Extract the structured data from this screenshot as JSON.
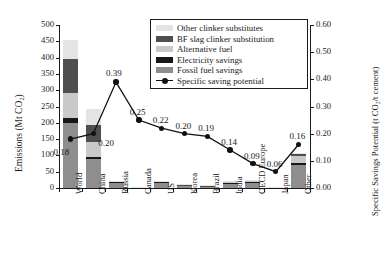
{
  "chart_data": {
    "type": "bar",
    "title": "",
    "subtitle": "",
    "xlabel": "",
    "ylabel": "Emissions (Mt CO2)",
    "ylabel_right": "Specific Savings Potential (t CO2/t cement)",
    "categories": [
      "World",
      "China",
      "Russia",
      "Canada",
      "US",
      "Korea",
      "Brazil",
      "India",
      "OECD Europe",
      "Japan",
      "Other"
    ],
    "ylim": [
      0,
      500
    ],
    "yticks": [
      "0",
      "50",
      "100",
      "150",
      "200",
      "250",
      "300",
      "350",
      "400",
      "450",
      "500"
    ],
    "ylim_right": [
      0,
      0.6
    ],
    "yticks_right": [
      "0.00",
      "0.10",
      "0.20",
      "0.30",
      "0.40",
      "0.50",
      "0.60"
    ],
    "grid": false,
    "legend_position": "top-right",
    "stacked": true,
    "series": [
      {
        "name": "Fossil fuel savings",
        "color": "#8e8e8e",
        "values": [
          200,
          88,
          16,
          2,
          16,
          7,
          5,
          15,
          16,
          2,
          72
        ]
      },
      {
        "name": "Electricity savings",
        "color": "#171717",
        "values": [
          14,
          7,
          1,
          0.3,
          1.5,
          1,
          0.6,
          1.5,
          1.5,
          0.3,
          6
        ]
      },
      {
        "name": "Alternative fuel",
        "color": "#c9c9c9",
        "values": [
          76,
          45,
          4,
          0.5,
          4,
          2,
          1.5,
          4,
          5,
          0.5,
          20
        ]
      },
      {
        "name": "BF slag clinker substitution",
        "color": "#4f4f4f",
        "values": [
          105,
          52,
          1,
          0.2,
          1,
          0.5,
          0.4,
          1,
          1.5,
          0.2,
          6
        ]
      },
      {
        "name": "Other clinker substitutes",
        "color": "#e4e4e4",
        "values": [
          60,
          50,
          0.5,
          0.1,
          0.5,
          0.3,
          0.2,
          0.5,
          0.8,
          0.1,
          3
        ]
      }
    ],
    "line_series": {
      "name": "Specific saving potential",
      "color": "#111111",
      "values": [
        0.18,
        0.2,
        0.39,
        0.25,
        0.22,
        0.2,
        0.19,
        0.14,
        0.09,
        0.06,
        0.16
      ],
      "labels": [
        "0.18",
        "0.20",
        "0.39",
        "0.25",
        "0.22",
        "0.20",
        "0.19",
        "0.14",
        "0.09",
        "0.06",
        "0.16"
      ]
    },
    "legend_entries": [
      {
        "label": "Other clinker substitutes",
        "color": "#e4e4e4",
        "type": "swatch"
      },
      {
        "label": "BF slag clinker substitution",
        "color": "#4f4f4f",
        "type": "swatch"
      },
      {
        "label": "Alternative fuel",
        "color": "#c9c9c9",
        "type": "swatch"
      },
      {
        "label": "Electricity savings",
        "color": "#171717",
        "type": "swatch"
      },
      {
        "label": "Fossil fuel savings",
        "color": "#8e8e8e",
        "type": "swatch"
      },
      {
        "label": "Specific saving potential",
        "color": "#111111",
        "type": "line-marker"
      }
    ]
  }
}
